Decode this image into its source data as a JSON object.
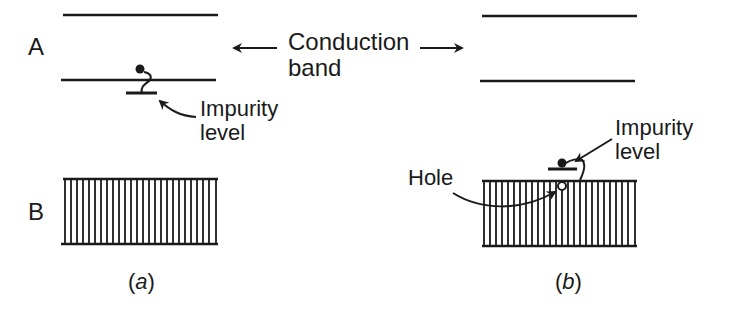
{
  "diagram": {
    "row_labels": {
      "top": "A",
      "bottom": "B"
    },
    "center_label": {
      "line1": "Conduction",
      "line2": "band"
    },
    "panel_a": {
      "caption_open": "(",
      "caption_letter": "a",
      "caption_close": ")",
      "impurity_label": {
        "line1": "Impurity",
        "line2": "level"
      }
    },
    "panel_b": {
      "caption_open": "(",
      "caption_letter": "b",
      "caption_close": ")",
      "impurity_label": {
        "line1": "Impurity",
        "line2": "level"
      },
      "hole_label": "Hole"
    },
    "colors": {
      "ink": "#1a1a1a",
      "background": "#ffffff"
    }
  }
}
